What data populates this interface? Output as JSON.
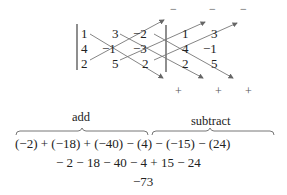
{
  "matrix": {
    "rows": [
      [
        "1",
        "3",
        "−2"
      ],
      [
        "4",
        "−1",
        "−3"
      ],
      [
        "2",
        "5",
        "2"
      ]
    ],
    "repeated_columns": [
      [
        "1",
        "4",
        "2"
      ],
      [
        "3",
        "−1",
        "5"
      ]
    ]
  },
  "signs": {
    "top": [
      "−",
      "−",
      "−"
    ],
    "bottom": [
      "+",
      "+",
      "+"
    ]
  },
  "labels": {
    "add": "add",
    "subtract": "subtract"
  },
  "equations": {
    "line1": "(−2) + (−18) + (−40) − (4) − (−15) − (24)",
    "line2": "− 2 − 18 − 40 − 4 + 15 − 24",
    "result": "−73"
  },
  "colors": {
    "arrow": "#666666",
    "text": "#222222"
  }
}
